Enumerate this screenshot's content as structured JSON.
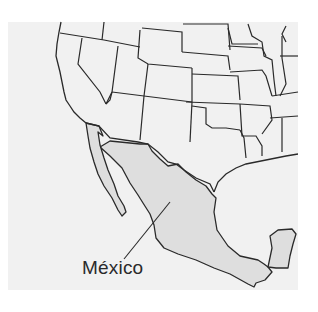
{
  "map": {
    "region": "Southwestern United States and Mexico",
    "highlighted_country": "México",
    "labels": [
      {
        "text": "México",
        "points_to": "Mexico"
      }
    ],
    "colors": {
      "background": "#ffffff",
      "panel": "#f1f1f1",
      "highlight_fill": "#dedede",
      "border_stroke": "#2a2a2a"
    }
  }
}
